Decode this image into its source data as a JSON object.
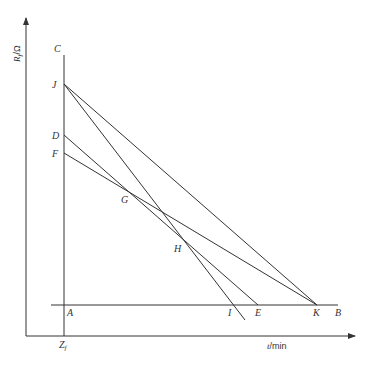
{
  "diagram": {
    "type": "line-construction-graph",
    "axes": {
      "y_label_var": "R",
      "y_label_sub": "f",
      "y_label_unit": "/Ω",
      "x_label_var": "t",
      "x_label_unit": "/min",
      "origin_label_var": "Z",
      "origin_label_sub": "f"
    },
    "points": {
      "C": "C",
      "J": "J",
      "D": "D",
      "F": "F",
      "G": "G",
      "H": "H",
      "A": "A",
      "I": "I",
      "E": "E",
      "K": "K",
      "B": "B"
    },
    "segments": [
      {
        "from": "A",
        "to": "C",
        "desc": "vertical line through Zf"
      },
      {
        "from": "A",
        "to": "B",
        "desc": "horizontal baseline"
      },
      {
        "from": "J",
        "to": "K"
      },
      {
        "from": "J",
        "to": "I",
        "desc": "extends past I below baseline"
      },
      {
        "from": "D",
        "to": "E"
      },
      {
        "from": "F",
        "to": "K"
      }
    ],
    "intersections": [
      {
        "label": "G",
        "lines": [
          "DE",
          "FK"
        ]
      },
      {
        "label": "H",
        "lines": [
          "JI",
          "FK"
        ]
      }
    ],
    "colors": {
      "line": "#333333",
      "background": "#ffffff"
    }
  }
}
